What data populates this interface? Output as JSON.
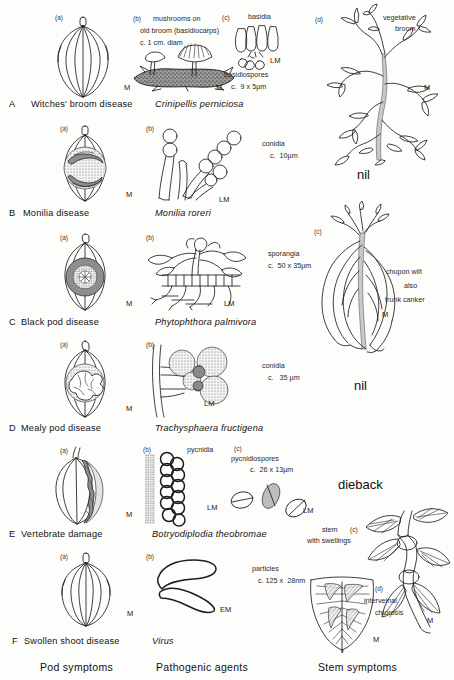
{
  "figure": {
    "columns": [
      {
        "label": "Pod symptoms"
      },
      {
        "label": "Pathogenic agents"
      },
      {
        "label": "Stem symptoms"
      }
    ],
    "rows": [
      {
        "letter": "A",
        "disease": "Witches' broom disease",
        "agent": "Crinipellis perniciosa",
        "pod": {
          "tag": "(a)",
          "mag": "M"
        },
        "agent_panels": [
          {
            "tag": "(b)",
            "caption_lines": [
              "mushrooms on",
              "old broom (basidiocarps)",
              "c. 1 cm. diam"
            ],
            "mag": "M"
          },
          {
            "tag": "(c)",
            "caption_lines": [
              "basidia"
            ],
            "extra_lines": [
              "basidiospores",
              "c.  9 x 5µm"
            ],
            "mag": "LM"
          }
        ],
        "stem": {
          "tag": "(d)",
          "caption_lines": [
            "vegetative",
            "broom"
          ],
          "mag": "M",
          "note": ""
        }
      },
      {
        "letter": "B",
        "disease": "Monilia  disease",
        "agent": "Monilia roreri",
        "pod": {
          "tag": "(a)",
          "mag": "M"
        },
        "agent_panels": [
          {
            "tag": "(b)",
            "caption_lines": [
              "conidia",
              "c.  10µm"
            ],
            "mag": "LM"
          }
        ],
        "stem": {
          "tag": "",
          "caption_lines": [],
          "mag": "",
          "note": "nil"
        }
      },
      {
        "letter": "C",
        "disease": "Black  pod  disease",
        "agent": "Phytophthora palmivora",
        "pod": {
          "tag": "(a)",
          "mag": "M"
        },
        "agent_panels": [
          {
            "tag": "(b)",
            "caption_lines": [
              "sporangia",
              "c.  50 x 35µm"
            ],
            "mag": "LM"
          }
        ],
        "stem": {
          "tag": "(c)",
          "caption_lines": [
            "chupon wilt",
            "also",
            "trunk  canker"
          ],
          "mag": "M",
          "note": ""
        }
      },
      {
        "letter": "D",
        "disease": "Mealy  pod  disease",
        "agent": "Trachysphaera  fructigena",
        "pod": {
          "tag": "(a)",
          "mag": "M"
        },
        "agent_panels": [
          {
            "tag": "(b)",
            "caption_lines": [
              "conidia",
              "c.   35 µm"
            ],
            "mag": "LM"
          }
        ],
        "stem": {
          "tag": "",
          "caption_lines": [],
          "mag": "",
          "note": "nil"
        }
      },
      {
        "letter": "E",
        "disease": "Vertebrate   damage",
        "agent": "Botryodiplodia  theobromae",
        "pod": {
          "tag": "(a)",
          "mag": "M"
        },
        "agent_panels": [
          {
            "tag": "(b)",
            "caption_lines": [
              "pycnidia"
            ],
            "mag": "LM"
          },
          {
            "tag": "(c)",
            "caption_lines": [
              "pycnidiospores",
              "c.  26 x 13µm"
            ],
            "mag": "LM"
          }
        ],
        "stem": {
          "tag": "",
          "caption_lines": [],
          "mag": "",
          "note": "dieback"
        }
      },
      {
        "letter": "F",
        "disease": "Swollen  shoot disease",
        "agent": "Virus",
        "pod": {
          "tag": "(a)",
          "mag": "M"
        },
        "agent_panels": [
          {
            "tag": "(b)",
            "caption_lines": [
              "particles",
              "c. 125 x  28nm"
            ],
            "mag": "EM"
          }
        ],
        "stem_panels": [
          {
            "tag": "(c)",
            "caption_lines": [
              "stem",
              "with swellings"
            ],
            "mag": "M"
          },
          {
            "tag": "(d)",
            "caption_lines": [
              "interveinal",
              "chlorosis"
            ],
            "mag": "M"
          }
        ]
      }
    ]
  }
}
